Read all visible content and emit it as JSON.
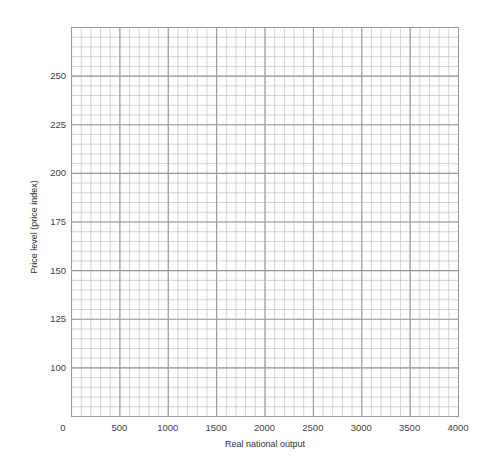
{
  "chart_data": {
    "type": "line",
    "title": "",
    "xlabel": "Real national output",
    "ylabel": "Price level (price index)",
    "xlim": [
      0,
      4000
    ],
    "ylim": [
      75,
      275
    ],
    "x_ticks": [
      0,
      500,
      1000,
      1500,
      2000,
      2500,
      3000,
      3500,
      4000
    ],
    "x_tick_labels": [
      "0",
      "500",
      "1000",
      "1500",
      "2000",
      "2500",
      "3000",
      "3500",
      "4000"
    ],
    "y_ticks": [
      100,
      125,
      150,
      175,
      200,
      225,
      250
    ],
    "y_tick_labels": [
      "100",
      "125",
      "150",
      "175",
      "200",
      "225",
      "250"
    ],
    "x_minor_step": 100,
    "y_minor_step": 5,
    "grid": true,
    "series": [],
    "legend": null
  },
  "colors": {
    "major_grid": "#9a9a9a",
    "minor_grid": "#c8c8c8",
    "text": "#444444"
  }
}
